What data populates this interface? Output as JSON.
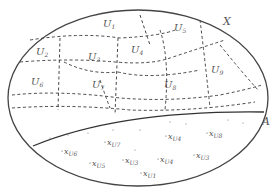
{
  "diagram": {
    "set_label": "X",
    "subset_label": "A",
    "regions": [
      {
        "name": "U",
        "sub": "1",
        "x": 103,
        "y": 27
      },
      {
        "name": "U",
        "sub": "2",
        "x": 36,
        "y": 55
      },
      {
        "name": "U",
        "sub": "3",
        "x": 88,
        "y": 60
      },
      {
        "name": "U",
        "sub": "4",
        "x": 131,
        "y": 53
      },
      {
        "name": "U",
        "sub": "5",
        "x": 174,
        "y": 31
      },
      {
        "name": "U",
        "sub": "6",
        "x": 31,
        "y": 85
      },
      {
        "name": "U",
        "sub": "7",
        "x": 92,
        "y": 88
      },
      {
        "name": "U",
        "sub": "8",
        "x": 164,
        "y": 88
      },
      {
        "name": "U",
        "sub": "9",
        "x": 211,
        "y": 73
      }
    ],
    "points": [
      {
        "label": "x",
        "sub": "U6",
        "x": 64,
        "y": 154
      },
      {
        "label": "x",
        "sub": "U7",
        "x": 107,
        "y": 145
      },
      {
        "label": "x",
        "sub": "U5",
        "x": 92,
        "y": 166
      },
      {
        "label": "x",
        "sub": "U3",
        "x": 125,
        "y": 163
      },
      {
        "label": "x",
        "sub": "U4",
        "x": 168,
        "y": 139
      },
      {
        "label": "x",
        "sub": "U8",
        "x": 209,
        "y": 136
      },
      {
        "label": "x",
        "sub": "U4",
        "x": 160,
        "y": 162
      },
      {
        "label": "x",
        "sub": "U1",
        "x": 143,
        "y": 176
      },
      {
        "label": "x",
        "sub": "U3",
        "x": 196,
        "y": 158
      }
    ]
  }
}
